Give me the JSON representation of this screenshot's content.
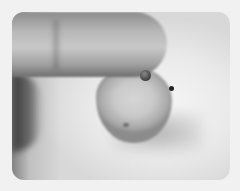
{
  "image": {
    "description": "Grayscale photo of a fingertip holding a small rounded bead-like object with a stem and a small hole",
    "colors": {
      "page_background": "#f1f1f1",
      "photo_background": "#e6e6e6",
      "finger": "#b8b8b8",
      "object": "#c9c9c9",
      "hole": "#222222"
    }
  }
}
